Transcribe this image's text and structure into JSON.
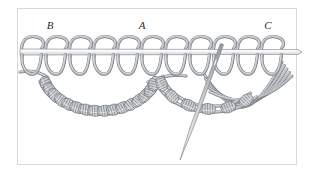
{
  "figure": {
    "type": "technical-illustration",
    "width": 314,
    "height": 184
  },
  "colors": {
    "background": "#ffffff",
    "border": "#d8d8d8",
    "cord_stroke": "#7e8185",
    "cord_fill": "#b9bcc0",
    "cord_highlight": "#e6e8ea",
    "cord_shadow": "#6f7378",
    "bar_fill": "#efefef",
    "bar_stroke": "#9a9da1",
    "needle_fill": "#cfd2d5",
    "needle_stroke": "#8a8d92",
    "label_color": "#2b2b2b"
  },
  "labels": [
    {
      "text": "B",
      "x": 50,
      "y": 29
    },
    {
      "text": "A",
      "x": 142,
      "y": 29
    },
    {
      "text": "C",
      "x": 268,
      "y": 29
    }
  ],
  "border": {
    "x": 17,
    "y": 8,
    "width": 279,
    "height": 156,
    "stroke_width": 1
  },
  "bar": {
    "name": "horizontal-foundation-bar",
    "x1": 20,
    "x2": 302,
    "y": 52,
    "thickness": 6
  },
  "top_loops": {
    "name": "vertical-cord-loops",
    "count": 11,
    "start_x": 32,
    "spacing": 24,
    "loop_width": 20,
    "loop_top": 36,
    "loop_bottom": 74,
    "stroke_width": 3.2
  },
  "knot_arcs": [
    {
      "name": "left-knotted-arc",
      "label_ref": "B",
      "center_x": 100,
      "center_y": 70,
      "radius_x": 62,
      "radius_y": 44,
      "knot_count": 16,
      "start_angle": 165,
      "end_angle": 15
    },
    {
      "name": "right-knotted-arc",
      "label_ref": "C",
      "center_x": 212,
      "center_y": 70,
      "radius_x": 58,
      "radius_y": 42,
      "knot_count": 6,
      "start_angle": 170,
      "end_angle": 40
    }
  ],
  "needle": {
    "name": "threading-needle",
    "tip_x": 180,
    "tip_y": 160,
    "eye_x": 222,
    "eye_y": 44,
    "width": 3.4,
    "eye_offset": 0.16
  },
  "loose_strands": {
    "name": "unworked-cord-strands",
    "count": 5,
    "origin_x": 216,
    "origin_y": 58,
    "sweep_end_x": 282,
    "sweep_end_y": 62
  }
}
